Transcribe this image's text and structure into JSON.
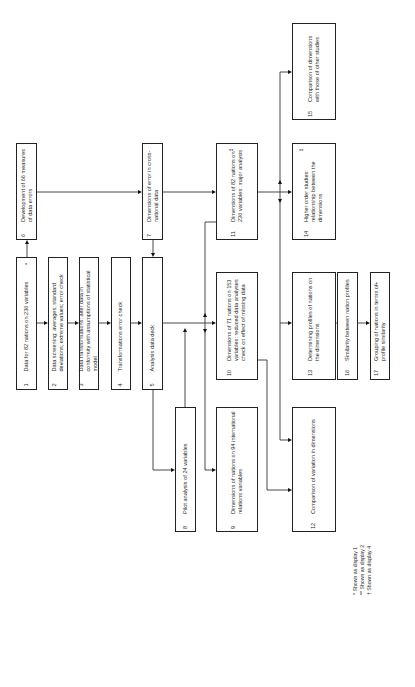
{
  "diagram": {
    "orientation": "rotated-90-ccw",
    "boxes": [
      {
        "id": "1",
        "number": "1",
        "text": "Data for 82 nations on 236 variables",
        "mark": "*"
      },
      {
        "id": "2",
        "number": "2",
        "text": "Data screening: averages; standard deviations; extreme values; error check",
        "mark": ""
      },
      {
        "id": "3",
        "number": "3",
        "text": "Data transformations: alter data in conformity with assumptions of statistical model",
        "mark": ""
      },
      {
        "id": "4",
        "number": "4",
        "text": "Transformations error check",
        "mark": ""
      },
      {
        "id": "5",
        "number": "5",
        "text": "Analysis data deck",
        "mark": ""
      },
      {
        "id": "6",
        "number": "6",
        "text": "Development of 66 measures of data errors",
        "mark": ""
      },
      {
        "id": "7",
        "number": "7",
        "text": "Dimensions of error in cross-national data",
        "mark": ""
      },
      {
        "id": "8",
        "number": "8",
        "text": "Pilot analysis of 24 variables",
        "mark": ""
      },
      {
        "id": "9",
        "number": "9",
        "text": "Dimensions of nations on 94 international relations variables",
        "mark": ""
      },
      {
        "id": "10",
        "number": "10",
        "text": "Dimensions of 71 nations on 153 variables: reduced data analyses check on effect of missing data",
        "mark": ""
      },
      {
        "id": "11",
        "number": "11",
        "text": "Dimensions of 82 nations on 236 variables: major analysis",
        "mark": "**"
      },
      {
        "id": "12",
        "number": "12",
        "text": "Comparison of variation in dimensions",
        "mark": ""
      },
      {
        "id": "13",
        "number": "13",
        "text": "Determining profiles of nations on the dimensions",
        "mark": ""
      },
      {
        "id": "14",
        "number": "14",
        "text": "Higher order studies: relationship between the dimensions",
        "mark": "**"
      },
      {
        "id": "15",
        "number": "15",
        "text": "Comparison of dimensions with those of other studies",
        "mark": ""
      },
      {
        "id": "16",
        "number": "16",
        "text": "Similarity between nation profiles",
        "mark": ""
      },
      {
        "id": "17",
        "number": "17",
        "text": "Grouping of nations in terms of profile similarity",
        "mark": "†"
      }
    ],
    "edges": [
      [
        "1",
        "2"
      ],
      [
        "2",
        "3"
      ],
      [
        "3",
        "4"
      ],
      [
        "4",
        "5"
      ],
      [
        "1",
        "6"
      ],
      [
        "6",
        "7"
      ],
      [
        "7",
        "5"
      ],
      [
        "7",
        "11"
      ],
      [
        "5",
        "8"
      ],
      [
        "8",
        "10"
      ],
      [
        "5",
        "10"
      ],
      [
        "5",
        "9"
      ],
      [
        "10",
        "12"
      ],
      [
        "11",
        "14"
      ],
      [
        "11",
        "13"
      ],
      [
        "11",
        "12"
      ],
      [
        "11",
        "15"
      ],
      [
        "13",
        "16"
      ],
      [
        "16",
        "17"
      ]
    ],
    "legend": [
      "* Shown as display 1",
      "** Shown as display 2",
      "† Shown as display 4"
    ]
  }
}
